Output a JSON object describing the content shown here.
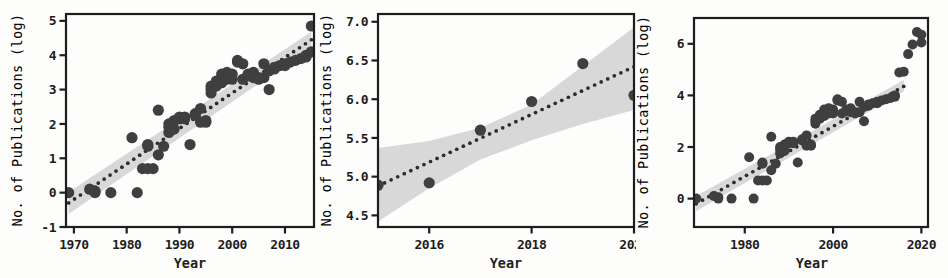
{
  "figure": {
    "background": "#fdfdfc",
    "ink_color": "#1d1d1d",
    "point_color": "#3f3f3f",
    "band_color": "#d6d6d6",
    "trend_color": "#2b2b2b",
    "panel_count": 3
  },
  "chart_data": [
    {
      "type": "scatter",
      "panel": "a",
      "title": "",
      "xlabel": "Year",
      "ylabel": "No. of Publications (log)",
      "xlim": [
        1968.5,
        2015.5
      ],
      "ylim": [
        -1,
        5.2
      ],
      "xticks": [
        1970,
        1980,
        1990,
        2000,
        2010
      ],
      "yticks": [
        -1,
        0,
        1,
        2,
        3,
        4,
        5
      ],
      "grid": false,
      "legend": "none",
      "series": [
        {
          "name": "observed",
          "marker": "filled-circle",
          "x": [
            1969,
            1973,
            1974,
            1974,
            1977,
            1981,
            1982,
            1983,
            1984,
            1984,
            1984,
            1985,
            1986,
            1986,
            1987,
            1988,
            1988,
            1988,
            1989,
            1989,
            1990,
            1990,
            1991,
            1991,
            1992,
            1993,
            1993,
            1994,
            1994,
            1995,
            1995,
            1996,
            1996,
            1996,
            1997,
            1997,
            1998,
            1998,
            1999,
            1999,
            2000,
            2000,
            2001,
            2001,
            2002,
            2002,
            2003,
            2003,
            2004,
            2004,
            2005,
            2005,
            2006,
            2006,
            2007,
            2007,
            2008,
            2008,
            2009,
            2010,
            2010,
            2011,
            2012,
            2013,
            2014,
            2014,
            2015,
            2015
          ],
          "y": [
            0.0,
            0.1,
            0.05,
            0.0,
            0.0,
            1.6,
            0.0,
            0.7,
            0.7,
            1.35,
            1.4,
            0.7,
            2.4,
            1.1,
            1.35,
            1.75,
            1.9,
            2.0,
            1.85,
            2.1,
            2.15,
            2.2,
            2.15,
            2.2,
            1.4,
            2.25,
            2.3,
            2.05,
            2.45,
            2.05,
            2.1,
            2.9,
            3.0,
            3.1,
            3.1,
            3.25,
            3.2,
            3.45,
            3.3,
            3.5,
            3.3,
            3.45,
            3.8,
            3.85,
            3.3,
            3.75,
            3.4,
            3.45,
            3.35,
            3.5,
            3.3,
            3.35,
            3.75,
            3.35,
            3.0,
            3.55,
            3.6,
            3.65,
            3.7,
            3.7,
            3.75,
            3.8,
            3.85,
            3.9,
            3.95,
            4.0,
            4.85,
            4.1
          ]
        }
      ],
      "fit": {
        "name": "trend",
        "style": "dotted",
        "x": [
          1969,
          2015
        ],
        "y": [
          -0.3,
          4.45
        ]
      },
      "confidence_band": {
        "name": "95% confidence interval",
        "fill": "#d8d8d8",
        "x": [
          1969,
          2015
        ],
        "lower": [
          -0.62,
          4.22
        ],
        "upper": [
          0.02,
          4.68
        ]
      }
    },
    {
      "type": "scatter",
      "panel": "b",
      "title": "",
      "xlabel": "Year",
      "ylabel": "No. of Publications (log)",
      "xlim": [
        2015.0,
        2020.0
      ],
      "ylim": [
        4.35,
        7.1
      ],
      "xticks": [
        2016,
        2018,
        2020
      ],
      "yticks": [
        4.5,
        5.0,
        5.5,
        6.0,
        6.5,
        7.0
      ],
      "grid": false,
      "legend": "none",
      "series": [
        {
          "name": "observed",
          "marker": "filled-circle",
          "x": [
            2015.0,
            2016.0,
            2017.0,
            2018.0,
            2019.0,
            2020.0
          ],
          "y": [
            4.89,
            4.92,
            5.6,
            5.97,
            6.46,
            6.05
          ]
        }
      ],
      "fit": {
        "name": "trend",
        "style": "dotted",
        "x": [
          2015.0,
          2020.0
        ],
        "y": [
          4.88,
          6.42
        ]
      },
      "confidence_band": {
        "name": "95% confidence interval",
        "fill": "#d8d8d8",
        "x": [
          2015.0,
          2016.0,
          2017.0,
          2018.0,
          2019.0,
          2020.0
        ],
        "lower": [
          4.42,
          4.85,
          5.22,
          5.47,
          5.68,
          5.86
        ],
        "upper": [
          5.37,
          5.46,
          5.63,
          5.93,
          6.43,
          6.93
        ]
      }
    },
    {
      "type": "scatter",
      "panel": "c",
      "title": "",
      "xlabel": "Year",
      "ylabel": "No. of Publications (log)",
      "xlim": [
        1968.5,
        2021.5
      ],
      "ylim": [
        -1.1,
        7.0
      ],
      "xticks": [
        1980,
        2000,
        2020
      ],
      "yticks": [
        0,
        2,
        4,
        6
      ],
      "grid": false,
      "legend": "none",
      "series": [
        {
          "name": "observed",
          "marker": "filled-circle",
          "x": [
            1969,
            1973,
            1974,
            1974,
            1977,
            1981,
            1982,
            1983,
            1984,
            1984,
            1984,
            1985,
            1986,
            1986,
            1987,
            1988,
            1988,
            1988,
            1989,
            1989,
            1990,
            1990,
            1991,
            1991,
            1992,
            1993,
            1993,
            1994,
            1994,
            1995,
            1995,
            1996,
            1996,
            1996,
            1997,
            1997,
            1998,
            1998,
            1999,
            1999,
            2000,
            2000,
            2001,
            2001,
            2002,
            2002,
            2003,
            2003,
            2004,
            2004,
            2005,
            2005,
            2006,
            2006,
            2007,
            2007,
            2008,
            2008,
            2009,
            2010,
            2010,
            2011,
            2012,
            2013,
            2014,
            2014,
            2015,
            2016,
            2017,
            2018,
            2019,
            2020,
            2020
          ],
          "y": [
            0.0,
            0.1,
            0.05,
            0.0,
            0.0,
            1.6,
            0.0,
            0.7,
            0.7,
            1.35,
            1.4,
            0.7,
            2.4,
            1.1,
            1.35,
            1.75,
            1.9,
            2.0,
            1.85,
            2.1,
            2.15,
            2.2,
            2.15,
            2.2,
            1.4,
            2.25,
            2.3,
            2.05,
            2.45,
            2.05,
            2.1,
            2.9,
            3.0,
            3.1,
            3.1,
            3.25,
            3.2,
            3.45,
            3.3,
            3.5,
            3.3,
            3.45,
            3.8,
            3.85,
            3.3,
            3.75,
            3.4,
            3.45,
            3.35,
            3.5,
            3.3,
            3.35,
            3.75,
            3.35,
            3.0,
            3.55,
            3.6,
            3.65,
            3.7,
            3.7,
            3.75,
            3.8,
            3.85,
            3.9,
            3.95,
            4.0,
            4.89,
            4.92,
            5.6,
            5.97,
            6.46,
            6.05,
            6.35
          ]
        }
      ],
      "fit": {
        "name": "trend",
        "style": "dotted",
        "x": [
          1969,
          2016
        ],
        "y": [
          -0.2,
          4.35
        ]
      },
      "confidence_band": {
        "name": "95% confidence interval",
        "fill": "#d8d8d8",
        "x": [
          1969,
          2016
        ],
        "lower": [
          -0.48,
          4.15
        ],
        "upper": [
          0.1,
          4.6
        ]
      }
    }
  ],
  "panels": [
    {
      "id": "panel-a",
      "ylabel": "No. of Publications (log)",
      "xlabel": "Year",
      "yticks": [
        "5",
        "4",
        "3",
        "2",
        "1",
        "0",
        "-1"
      ],
      "xticks": [
        "1970",
        "1980",
        "1990",
        "2000",
        "2010"
      ]
    },
    {
      "id": "panel-b",
      "ylabel": "No. of Publications (log)",
      "xlabel": "Year",
      "yticks": [
        "7.0",
        "6.5",
        "6.0",
        "5.5",
        "5.0",
        "4.5"
      ],
      "xticks": [
        "2016",
        "2018",
        "2020"
      ]
    },
    {
      "id": "panel-c",
      "ylabel": "No. of Publications (log)",
      "xlabel": "Year",
      "yticks": [
        "6",
        "4",
        "2",
        "0"
      ],
      "xticks": [
        "1980",
        "2000",
        "2020"
      ]
    }
  ]
}
